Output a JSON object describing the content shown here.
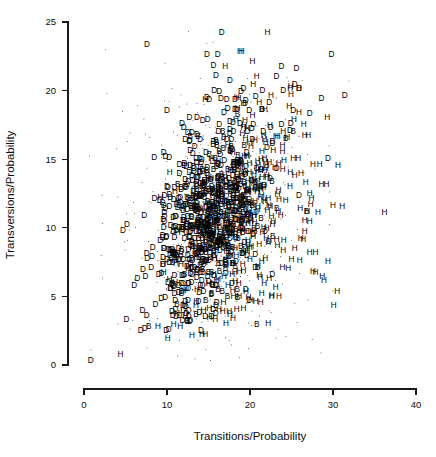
{
  "figure": {
    "background_color": "#ffffff",
    "foreground_color": "#000000",
    "width": 436,
    "height": 457
  },
  "chart_data": {
    "type": "scatter",
    "title": "",
    "xlabel": "Transitions/Probability",
    "ylabel": "Transversions/Probability",
    "xlim": [
      0,
      40
    ],
    "ylim": [
      0,
      25
    ],
    "xticks": [
      0,
      10,
      20,
      30,
      40
    ],
    "yticks": [
      0,
      5,
      10,
      15,
      20,
      25
    ],
    "xtick_labels": [
      "0",
      "10",
      "20",
      "30",
      "40"
    ],
    "ytick_labels": [
      "0",
      "5",
      "10",
      "15",
      "20",
      "25"
    ],
    "grid": false,
    "legend": null,
    "marker_style": "text-label",
    "marker_classes": [
      "D",
      "H",
      "B"
    ],
    "marker_note": "Each data point is drawn as the single capital letter of its group class; tiny dots are unlabeled background points.",
    "point_count_approx": 1450,
    "series": [
      {
        "name": "D",
        "label": "D",
        "color": "#000000",
        "points": [
          [
            7.6,
            23.3
          ],
          [
            16.6,
            24.2
          ],
          [
            14.8,
            22.6
          ],
          [
            16.1,
            22.6
          ],
          [
            29.8,
            22.6
          ],
          [
            15.6,
            21.8
          ],
          [
            15.9,
            21.1
          ],
          [
            23.8,
            21.7
          ],
          [
            25.6,
            21.6
          ],
          [
            17.6,
            20.7
          ],
          [
            23.2,
            21.0
          ],
          [
            25.4,
            20.4
          ],
          [
            24.0,
            20.0
          ],
          [
            25.9,
            20.1
          ],
          [
            31.4,
            19.6
          ],
          [
            15.7,
            20.0
          ],
          [
            16.3,
            19.9
          ],
          [
            18.9,
            19.9
          ],
          [
            21.5,
            20.0
          ],
          [
            19.2,
            20.1
          ],
          [
            14.8,
            19.5
          ],
          [
            15.1,
            19.3
          ],
          [
            16.5,
            19.4
          ],
          [
            17.2,
            19.3
          ],
          [
            18.2,
            19.3
          ],
          [
            19.4,
            19.0
          ],
          [
            22.3,
            19.1
          ],
          [
            28.6,
            19.4
          ],
          [
            10.0,
            18.5
          ],
          [
            17.3,
            18.7
          ],
          [
            18.4,
            18.6
          ],
          [
            19.9,
            18.5
          ],
          [
            21.4,
            18.6
          ],
          [
            25.2,
            18.5
          ],
          [
            27.2,
            18.3
          ],
          [
            12.7,
            18.0
          ],
          [
            13.6,
            18.0
          ],
          [
            14.9,
            17.9
          ],
          [
            11.8,
            17.6
          ],
          [
            12.0,
            17.3
          ],
          [
            16.3,
            17.5
          ],
          [
            17.6,
            17.7
          ],
          [
            18.8,
            17.6
          ],
          [
            20.4,
            17.5
          ],
          [
            23.8,
            17.5
          ],
          [
            24.9,
            17.6
          ],
          [
            12.5,
            16.9
          ],
          [
            13.0,
            16.9
          ],
          [
            13.6,
            16.8
          ],
          [
            16.2,
            17.0
          ],
          [
            18.0,
            17.0
          ],
          [
            19.7,
            17.0
          ],
          [
            21.6,
            17.0
          ],
          [
            24.8,
            17.1
          ],
          [
            12.2,
            16.4
          ],
          [
            12.7,
            16.3
          ],
          [
            14.0,
            16.4
          ],
          [
            15.6,
            16.3
          ],
          [
            17.2,
            16.4
          ],
          [
            20.3,
            16.4
          ],
          [
            22.7,
            16.3
          ],
          [
            9.6,
            15.5
          ],
          [
            9.8,
            15.2
          ],
          [
            12.8,
            15.6
          ],
          [
            13.1,
            15.4
          ],
          [
            14.7,
            15.5
          ],
          [
            17.6,
            15.6
          ],
          [
            19.6,
            15.5
          ],
          [
            29.4,
            15.0
          ],
          [
            11.5,
            14.6
          ],
          [
            12.8,
            14.5
          ],
          [
            14.0,
            14.4
          ],
          [
            16.5,
            14.5
          ],
          [
            18.1,
            14.4
          ],
          [
            20.8,
            14.3
          ],
          [
            11.5,
            13.9
          ],
          [
            13.0,
            13.8
          ],
          [
            14.8,
            13.9
          ],
          [
            16.2,
            13.7
          ],
          [
            19.1,
            13.7
          ],
          [
            10.0,
            13.0
          ],
          [
            10.9,
            12.9
          ],
          [
            12.4,
            13.1
          ],
          [
            13.6,
            13.0
          ],
          [
            15.4,
            13.0
          ],
          [
            18.2,
            13.0
          ],
          [
            20.7,
            12.9
          ],
          [
            9.7,
            12.3
          ],
          [
            10.4,
            12.2
          ],
          [
            11.6,
            12.2
          ],
          [
            13.2,
            12.3
          ],
          [
            15.5,
            12.2
          ],
          [
            18.0,
            12.1
          ],
          [
            9.6,
            11.6
          ],
          [
            10.3,
            11.5
          ],
          [
            11.5,
            11.6
          ],
          [
            13.0,
            11.4
          ],
          [
            15.7,
            11.5
          ],
          [
            9.7,
            10.8
          ],
          [
            11.0,
            10.8
          ],
          [
            12.5,
            10.8
          ],
          [
            14.4,
            10.7
          ],
          [
            16.9,
            10.8
          ],
          [
            9.6,
            10.0
          ],
          [
            10.8,
            10.0
          ],
          [
            12.3,
            10.1
          ],
          [
            14.0,
            10.0
          ],
          [
            16.3,
            10.0
          ],
          [
            18.9,
            10.0
          ],
          [
            21.8,
            9.7
          ],
          [
            9.9,
            9.3
          ],
          [
            10.9,
            9.3
          ],
          [
            12.1,
            9.2
          ],
          [
            13.8,
            9.2
          ],
          [
            15.4,
            9.2
          ],
          [
            9.6,
            8.5
          ],
          [
            10.2,
            8.4
          ],
          [
            11.4,
            8.5
          ],
          [
            12.6,
            8.4
          ],
          [
            14.1,
            8.5
          ],
          [
            9.5,
            7.8
          ],
          [
            10.0,
            7.7
          ],
          [
            11.2,
            7.8
          ],
          [
            12.7,
            7.7
          ],
          [
            14.3,
            7.7
          ],
          [
            9.0,
            6.6
          ],
          [
            10.9,
            6.5
          ],
          [
            11.8,
            6.5
          ],
          [
            13.0,
            6.6
          ],
          [
            14.9,
            6.4
          ],
          [
            10.7,
            5.9
          ],
          [
            11.4,
            5.8
          ],
          [
            12.6,
            5.9
          ],
          [
            14.3,
            5.8
          ],
          [
            16.0,
            5.8
          ],
          [
            9.3,
            4.8
          ],
          [
            11.0,
            4.7
          ],
          [
            12.2,
            4.6
          ],
          [
            13.8,
            4.6
          ],
          [
            16.0,
            4.5
          ],
          [
            19.9,
            4.7
          ],
          [
            10.6,
            3.9
          ],
          [
            10.7,
            3.6
          ],
          [
            12.3,
            3.7
          ],
          [
            13.9,
            3.8
          ],
          [
            15.9,
            4.3
          ],
          [
            9.9,
            2.5
          ],
          [
            14.1,
            2.5
          ],
          [
            0.8,
            0.3
          ]
        ]
      },
      {
        "name": "H",
        "label": "H",
        "color": "#000000",
        "points": [
          [
            22.1,
            24.2
          ],
          [
            18.8,
            22.8
          ],
          [
            19.0,
            22.8
          ],
          [
            20.3,
            22.1
          ],
          [
            17.0,
            21.7
          ],
          [
            20.8,
            21.0
          ],
          [
            20.4,
            20.4
          ],
          [
            24.9,
            20.3
          ],
          [
            25.9,
            20.1
          ],
          [
            18.4,
            19.5
          ],
          [
            18.6,
            19.4
          ],
          [
            14.6,
            19.3
          ],
          [
            19.2,
            19.0
          ],
          [
            18.5,
            18.7
          ],
          [
            21.8,
            18.6
          ],
          [
            25.9,
            18.4
          ],
          [
            29.3,
            18.0
          ],
          [
            18.3,
            17.9
          ],
          [
            19.4,
            17.8
          ],
          [
            24.0,
            17.0
          ],
          [
            26.6,
            16.7
          ],
          [
            27.0,
            16.7
          ],
          [
            23.9,
            16.0
          ],
          [
            25.8,
            15.0
          ],
          [
            27.6,
            14.6
          ],
          [
            28.4,
            14.6
          ],
          [
            30.6,
            14.5
          ],
          [
            25.2,
            15.0
          ],
          [
            26.7,
            13.3
          ],
          [
            28.6,
            13.1
          ],
          [
            29.2,
            13.1
          ],
          [
            27.2,
            12.5
          ],
          [
            27.4,
            12.1
          ],
          [
            27.3,
            11.7
          ],
          [
            30.0,
            11.6
          ],
          [
            31.1,
            11.5
          ],
          [
            26.9,
            11.2
          ],
          [
            28.2,
            11.1
          ],
          [
            36.2,
            11.1
          ],
          [
            26.6,
            10.5
          ],
          [
            27.2,
            10.4
          ],
          [
            26.6,
            9.7
          ],
          [
            26.1,
            9.2
          ],
          [
            26.4,
            9.1
          ],
          [
            25.4,
            8.5
          ],
          [
            27.2,
            8.2
          ],
          [
            27.9,
            8.2
          ],
          [
            25.0,
            7.7
          ],
          [
            26.0,
            7.6
          ],
          [
            29.4,
            7.5
          ],
          [
            23.9,
            7.1
          ],
          [
            24.6,
            7.0
          ],
          [
            27.6,
            6.8
          ],
          [
            27.9,
            6.7
          ],
          [
            28.7,
            6.4
          ],
          [
            28.9,
            6.1
          ],
          [
            30.5,
            5.3
          ],
          [
            30.1,
            4.3
          ],
          [
            22.3,
            6.3
          ],
          [
            21.7,
            5.9
          ],
          [
            23.1,
            5.6
          ],
          [
            21.4,
            5.2
          ],
          [
            22.6,
            5.0
          ],
          [
            23.5,
            5.0
          ],
          [
            20.7,
            4.6
          ],
          [
            21.3,
            4.5
          ],
          [
            19.8,
            4.9
          ],
          [
            18.0,
            5.0
          ],
          [
            16.8,
            4.5
          ],
          [
            13.5,
            4.3
          ],
          [
            15.1,
            4.1
          ],
          [
            11.2,
            3.7
          ],
          [
            12.2,
            3.5
          ],
          [
            10.8,
            2.9
          ],
          [
            11.6,
            2.8
          ],
          [
            13.0,
            2.1
          ],
          [
            14.2,
            2.2
          ],
          [
            14.6,
            2.2
          ],
          [
            8.9,
            2.8
          ],
          [
            10.1,
            1.9
          ],
          [
            16.7,
            3.9
          ],
          [
            17.5,
            3.9
          ],
          [
            18.4,
            4.0
          ],
          [
            19.2,
            4.1
          ],
          [
            15.8,
            3.3
          ],
          [
            17.1,
            3.0
          ],
          [
            9.6,
            6.7
          ],
          [
            10.3,
            6.2
          ],
          [
            11.0,
            6.0
          ],
          [
            12.0,
            5.4
          ],
          [
            13.6,
            5.5
          ],
          [
            22.2,
            8.9
          ],
          [
            23.3,
            8.7
          ],
          [
            24.0,
            8.3
          ],
          [
            21.5,
            9.6
          ],
          [
            22.8,
            10.4
          ],
          [
            23.4,
            11.2
          ],
          [
            24.3,
            12.0
          ],
          [
            24.8,
            13.0
          ],
          [
            25.4,
            13.8
          ],
          [
            23.0,
            14.4
          ],
          [
            24.1,
            14.9
          ],
          [
            22.8,
            15.6
          ],
          [
            21.9,
            16.2
          ]
        ]
      },
      {
        "name": "B",
        "label": "B",
        "color": "#000000",
        "points": [
          [
            7.8,
            2.8
          ],
          [
            20.8,
            2.9
          ],
          [
            11.3,
            13.1
          ],
          [
            12.9,
            11.5
          ],
          [
            13.3,
            11.6
          ],
          [
            15.5,
            11.8
          ],
          [
            16.5,
            11.7
          ],
          [
            11.9,
            10.0
          ],
          [
            14.2,
            9.6
          ],
          [
            16.8,
            9.3
          ],
          [
            19.1,
            8.1
          ],
          [
            20.9,
            7.1
          ],
          [
            17.3,
            5.0
          ],
          [
            18.5,
            4.9
          ],
          [
            12.8,
            16.6
          ],
          [
            19.3,
            16.0
          ],
          [
            25.2,
            17.0
          ],
          [
            26.8,
            11.2
          ],
          [
            10.9,
            8.0
          ],
          [
            12.1,
            6.6
          ]
        ]
      }
    ]
  },
  "axes": {
    "x_axis_name": "x-axis",
    "y_axis_name": "y-axis"
  }
}
